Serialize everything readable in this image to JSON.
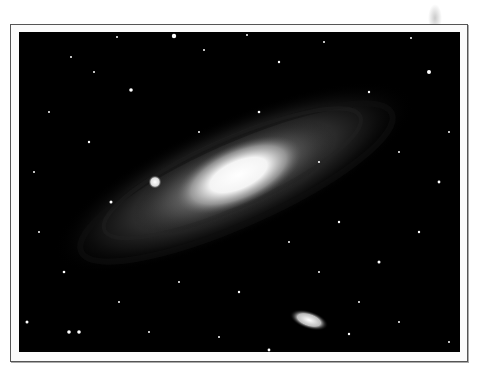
{
  "image": {
    "subject": "Andromeda galaxy",
    "description": "Black-and-white astronomical photograph of a spiral galaxy seen at an oblique angle, with a bright core, dust lanes, a small elliptical companion galaxy below, and a star field, printed with a white border and thin dark outline.",
    "colors": {
      "background": "#ffffff",
      "frame_border": "#555555",
      "sky": "#000000",
      "core": "#ffffff"
    }
  }
}
